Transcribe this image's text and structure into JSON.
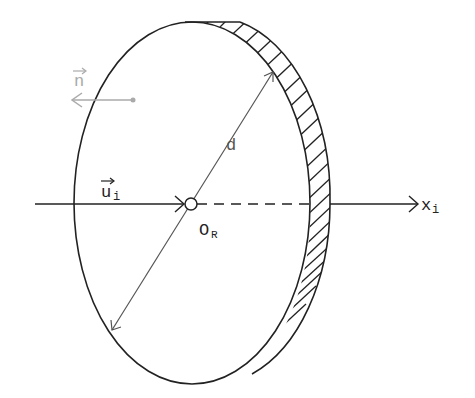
{
  "diagram": {
    "colors": {
      "stroke": "#222222",
      "secondary": "#555555",
      "faint": "#aaaaaa",
      "background": "#ffffff"
    },
    "labels": {
      "normal_vector": "n",
      "incident_vector": "u",
      "incident_vector_subscript": "i",
      "diameter": "d",
      "origin": "O",
      "origin_subscript": "R",
      "axis": "x",
      "axis_subscript": "i"
    },
    "elements": [
      {
        "name": "mirror-disc",
        "shape": "ellipse",
        "hatched_rim": true
      },
      {
        "name": "optical-axis",
        "direction": "left-to-right",
        "arrow": true
      },
      {
        "name": "diameter-line",
        "label": "d",
        "double_arrow": true
      },
      {
        "name": "normal-vector",
        "label": "n",
        "direction": "left",
        "style": "faint"
      },
      {
        "name": "incident-vector",
        "label": "u_i"
      },
      {
        "name": "origin-point",
        "label": "O_R"
      }
    ]
  }
}
